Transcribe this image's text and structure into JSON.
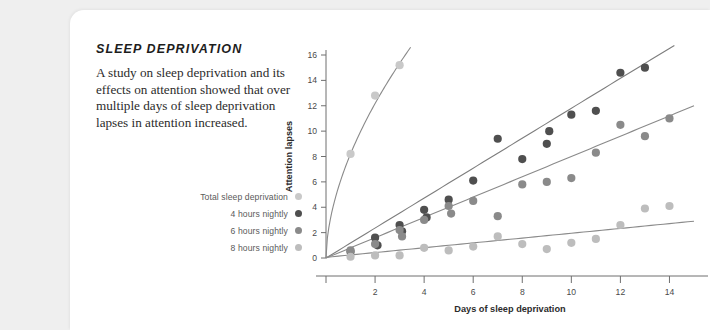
{
  "card": {
    "background": "#ffffff",
    "page_background": "#efefef"
  },
  "panel": {
    "title": "SLEEP DEPRIVATION",
    "body": "A study on sleep deprivation and its effects on attention showed that over multiple days of sleep deprivation lapses in attention increased."
  },
  "legend": {
    "items": [
      {
        "label": "Total sleep deprivation",
        "color": "#c9c9c9"
      },
      {
        "label": "4 hours nightly",
        "color": "#4f4f4f"
      },
      {
        "label": "6 hours nightly",
        "color": "#8a8a8a"
      },
      {
        "label": "8 hours nightly",
        "color": "#bdbdbd"
      }
    ]
  },
  "chart_data": {
    "type": "scatter",
    "title": "",
    "xlabel": "Days of sleep deprivation",
    "ylabel": "Attention lapses",
    "xlim": [
      0,
      15
    ],
    "ylim": [
      0,
      16
    ],
    "xticks": [
      0,
      2,
      4,
      6,
      8,
      10,
      12,
      14
    ],
    "yticks": [
      0,
      2,
      4,
      6,
      8,
      10,
      12,
      14,
      16
    ],
    "xtick_labels": [
      "0",
      "2",
      "4",
      "6",
      "8",
      "10",
      "12",
      "14"
    ],
    "ytick_labels": [
      "0",
      "2",
      "4",
      "6",
      "8",
      "10",
      "12",
      "14",
      "16"
    ],
    "grid": false,
    "legend_position": "left-outside",
    "series": [
      {
        "name": "Total sleep deprivation",
        "color": "#c9c9c9",
        "line_color": "#8a8a8a",
        "points": [
          {
            "x": 1.0,
            "y": 8.2
          },
          {
            "x": 2.0,
            "y": 12.8
          },
          {
            "x": 3.0,
            "y": 15.2
          }
        ],
        "trend": {
          "type": "power",
          "a": 8.2,
          "b": 0.57
        }
      },
      {
        "name": "4 hours nightly",
        "color": "#4f4f4f",
        "line_color": "#7d7d7d",
        "points": [
          {
            "x": 1.0,
            "y": 0.5
          },
          {
            "x": 2.0,
            "y": 1.6
          },
          {
            "x": 2.1,
            "y": 1.0
          },
          {
            "x": 3.0,
            "y": 2.6
          },
          {
            "x": 3.1,
            "y": 2.1
          },
          {
            "x": 4.0,
            "y": 3.8
          },
          {
            "x": 4.1,
            "y": 3.2
          },
          {
            "x": 5.0,
            "y": 4.6
          },
          {
            "x": 6.0,
            "y": 6.1
          },
          {
            "x": 7.0,
            "y": 9.4
          },
          {
            "x": 8.0,
            "y": 7.8
          },
          {
            "x": 9.0,
            "y": 9.0
          },
          {
            "x": 9.1,
            "y": 10.0
          },
          {
            "x": 10.0,
            "y": 11.3
          },
          {
            "x": 11.0,
            "y": 11.6
          },
          {
            "x": 12.0,
            "y": 14.6
          },
          {
            "x": 13.0,
            "y": 15.0
          }
        ],
        "trend": {
          "type": "linear",
          "intercept": 0.0,
          "slope": 1.18
        }
      },
      {
        "name": "6 hours nightly",
        "color": "#8a8a8a",
        "line_color": "#8a8a8a",
        "points": [
          {
            "x": 1.0,
            "y": 0.6
          },
          {
            "x": 2.0,
            "y": 1.1
          },
          {
            "x": 3.0,
            "y": 2.2
          },
          {
            "x": 3.1,
            "y": 1.7
          },
          {
            "x": 4.0,
            "y": 3.0
          },
          {
            "x": 5.0,
            "y": 4.1
          },
          {
            "x": 5.1,
            "y": 3.5
          },
          {
            "x": 6.0,
            "y": 4.5
          },
          {
            "x": 7.0,
            "y": 3.3
          },
          {
            "x": 8.0,
            "y": 5.8
          },
          {
            "x": 9.0,
            "y": 6.0
          },
          {
            "x": 10.0,
            "y": 6.3
          },
          {
            "x": 11.0,
            "y": 8.3
          },
          {
            "x": 12.0,
            "y": 10.5
          },
          {
            "x": 13.0,
            "y": 9.6
          },
          {
            "x": 14.0,
            "y": 11.0
          }
        ],
        "trend": {
          "type": "linear",
          "intercept": 0.0,
          "slope": 0.8
        }
      },
      {
        "name": "8 hours nightly",
        "color": "#bdbdbd",
        "line_color": "#8a8a8a",
        "points": [
          {
            "x": 1.0,
            "y": 0.1
          },
          {
            "x": 2.0,
            "y": 0.2
          },
          {
            "x": 3.0,
            "y": 0.2
          },
          {
            "x": 4.0,
            "y": 0.8
          },
          {
            "x": 5.0,
            "y": 0.6
          },
          {
            "x": 6.0,
            "y": 0.9
          },
          {
            "x": 7.0,
            "y": 1.7
          },
          {
            "x": 8.0,
            "y": 1.1
          },
          {
            "x": 9.0,
            "y": 0.7
          },
          {
            "x": 10.0,
            "y": 1.2
          },
          {
            "x": 11.0,
            "y": 1.5
          },
          {
            "x": 12.0,
            "y": 2.6
          },
          {
            "x": 13.0,
            "y": 3.9
          },
          {
            "x": 14.0,
            "y": 4.1
          }
        ],
        "trend": {
          "type": "linear",
          "intercept": 0.05,
          "slope": 0.19
        }
      }
    ]
  }
}
